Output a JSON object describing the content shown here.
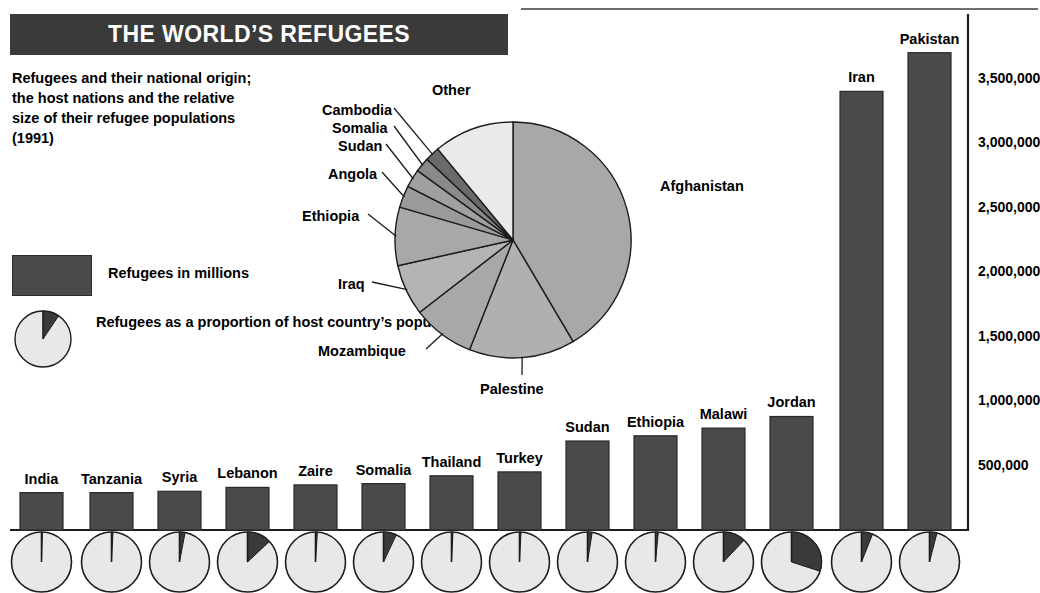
{
  "header": {
    "title": "THE WORLD’S REFUGEES",
    "subtitle": "Refugees and their national origin; the host nations and the relative size of their refugee populations (1991)"
  },
  "legend": {
    "bar_label": "Refugees in millions",
    "pie_label": "Refugees as a proportion of host country’s population",
    "bar_color": "#4a4a4a",
    "pie_fill": "#e8e8e8",
    "pie_slice": "#4a4a4a"
  },
  "chart_data": [
    {
      "type": "pie",
      "title": "Refugees by country of origin",
      "labels": [
        "Afghanistan",
        "Palestine",
        "Mozambique",
        "Iraq",
        "Ethiopia",
        "Angola",
        "Sudan",
        "Somalia",
        "Cambodia",
        "Other"
      ],
      "values": [
        41.5,
        14.5,
        8.5,
        7.0,
        8.0,
        3.0,
        2.5,
        2.0,
        2.0,
        11.0
      ],
      "slice_colors": [
        "#a8a8a8",
        "#b0b0b0",
        "#a8a8a8",
        "#b4b4b4",
        "#a8a8a8",
        "#9a9a9a",
        "#a0a0a0",
        "#8a8a8a",
        "#6a6a6a",
        "#eaeaea"
      ],
      "legend": "labels placed around pie with leader lines",
      "center": [
        513,
        240
      ],
      "radius": 118,
      "start_angle_deg": 0
    },
    {
      "type": "bar",
      "title": "Refugees in host nations",
      "xlabel": "",
      "ylabel": "",
      "categories": [
        "India",
        "Tanzania",
        "Syria",
        "Lebanon",
        "Zaire",
        "Somalia",
        "Thailand",
        "Turkey",
        "Sudan",
        "Ethiopia",
        "Malawi",
        "Jordan",
        "Iran",
        "Pakistan"
      ],
      "values": [
        290000,
        290000,
        300000,
        330000,
        350000,
        360000,
        420000,
        450000,
        690000,
        730000,
        790000,
        880000,
        3400000,
        3700000
      ],
      "ytick_labels": [
        "500,000",
        "1,000,000",
        "1,500,000",
        "2,000,000",
        "2,500,000",
        "3,000,000",
        "3,500,000"
      ],
      "yticks": [
        500000,
        1000000,
        1500000,
        2000000,
        2500000,
        3000000,
        3500000
      ],
      "ylim": [
        0,
        4000000
      ],
      "grid": false,
      "bar_color": "#4a4a4a",
      "axis_position": "right"
    },
    {
      "type": "pie",
      "title": "Refugees as a proportion of host country’s population",
      "categories": [
        "India",
        "Tanzania",
        "Syria",
        "Lebanon",
        "Zaire",
        "Somalia",
        "Thailand",
        "Turkey",
        "Sudan",
        "Ethiopia",
        "Malawi",
        "Jordan",
        "Iran",
        "Pakistan"
      ],
      "values_percent": [
        0.5,
        0.8,
        3.0,
        13.0,
        1.0,
        7.0,
        0.8,
        0.8,
        2.5,
        1.5,
        12.0,
        30.0,
        6.0,
        4.0
      ],
      "fill_color": "#e8e8e8",
      "slice_color": "#3a3a3a"
    }
  ]
}
